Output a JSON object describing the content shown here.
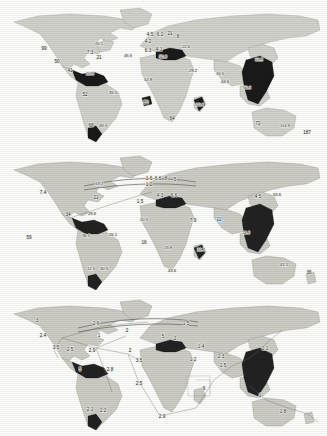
{
  "figure": {
    "type": "three-panel-world-map",
    "panel_count": 3,
    "background_color": "#fdfdfc",
    "land_color": "#d2d2cc",
    "highlight_color": "#1a1a1a",
    "flow_line_color": "#6d6d68"
  },
  "chart_data": {
    "type": "map",
    "title": "",
    "panels": [
      {
        "id": "panel-a",
        "index": 0,
        "has_flow_lines": false,
        "labels": [
          {
            "text": "99",
            "x": 44,
            "y": 50,
            "region": "western-north-america"
          },
          {
            "text": "50",
            "x": 57,
            "y": 63,
            "region": "baja-california"
          },
          {
            "text": "41",
            "x": 70,
            "y": 72,
            "region": "central-america"
          },
          {
            "text": "20.1",
            "x": 99,
            "y": 45,
            "region": "eastern-canada"
          },
          {
            "text": "7.3",
            "x": 90,
            "y": 54,
            "region": "northeast-usa"
          },
          {
            "text": "21",
            "x": 99,
            "y": 59,
            "region": "north-atlantic"
          },
          {
            "text": "20.6",
            "x": 90,
            "y": 75,
            "region": "caribbean"
          },
          {
            "text": "52",
            "x": 85,
            "y": 96,
            "region": "brazil-west"
          },
          {
            "text": "35.1",
            "x": 113,
            "y": 94,
            "region": "brazil-east"
          },
          {
            "text": "68",
            "x": 91,
            "y": 127,
            "region": "southern-cone-west"
          },
          {
            "text": "49.3",
            "x": 103,
            "y": 127,
            "region": "southern-cone-east"
          },
          {
            "text": "45.5",
            "x": 128,
            "y": 57,
            "region": "north-atlantic-east"
          },
          {
            "text": "4.5",
            "x": 150,
            "y": 36,
            "region": "north-sea"
          },
          {
            "text": "6.2",
            "x": 160,
            "y": 36,
            "region": "scandinavia"
          },
          {
            "text": "21",
            "x": 170,
            "y": 35,
            "region": "baltic"
          },
          {
            "text": "8",
            "x": 178,
            "y": 38,
            "region": "russia-west"
          },
          {
            "text": "4.2",
            "x": 148,
            "y": 43,
            "region": "british-isles"
          },
          {
            "text": "6.3",
            "x": 148,
            "y": 52,
            "region": "iberia"
          },
          {
            "text": "4.1",
            "x": 159,
            "y": 51,
            "region": "france"
          },
          {
            "text": "52.8",
            "x": 163,
            "y": 58,
            "region": "mediterranean"
          },
          {
            "text": "22.6",
            "x": 186,
            "y": 48,
            "region": "black-sea"
          },
          {
            "text": "52.8",
            "x": 148,
            "y": 81,
            "region": "west-africa"
          },
          {
            "text": "29.2",
            "x": 193,
            "y": 72,
            "region": "middle-east"
          },
          {
            "text": "50",
            "x": 146,
            "y": 104,
            "region": "gulf-of-guinea"
          },
          {
            "text": "64",
            "x": 172,
            "y": 120,
            "region": "southern-africa"
          },
          {
            "text": "20.6",
            "x": 200,
            "y": 106,
            "region": "madagascar"
          },
          {
            "text": "16.5",
            "x": 220,
            "y": 75,
            "region": "south-asia"
          },
          {
            "text": "44.6",
            "x": 225,
            "y": 83,
            "region": "india"
          },
          {
            "text": "63.5",
            "x": 259,
            "y": 61,
            "region": "east-asia"
          },
          {
            "text": "50.6",
            "x": 247,
            "y": 89,
            "region": "southeast-asia"
          },
          {
            "text": "72",
            "x": 258,
            "y": 125,
            "region": "australia-west"
          },
          {
            "text": "114.9",
            "x": 285,
            "y": 127,
            "region": "australia-east"
          },
          {
            "text": "187",
            "x": 307,
            "y": 134,
            "region": "new-zealand"
          }
        ]
      },
      {
        "id": "panel-b",
        "index": 1,
        "has_flow_lines": true,
        "labels": [
          {
            "text": "7.4",
            "x": 43,
            "y": 194,
            "region": "western-north-america"
          },
          {
            "text": "13.2",
            "x": 99,
            "y": 185,
            "region": "north-atlantic-route"
          },
          {
            "text": "21",
            "x": 96,
            "y": 199,
            "region": "north-atlantic"
          },
          {
            "text": "34",
            "x": 68,
            "y": 216,
            "region": "central-america"
          },
          {
            "text": "29.6",
            "x": 92,
            "y": 215,
            "region": "caribbean"
          },
          {
            "text": "36.5",
            "x": 86,
            "y": 237,
            "region": "brazil-west"
          },
          {
            "text": "26.1",
            "x": 113,
            "y": 236,
            "region": "brazil-east"
          },
          {
            "text": "12.5",
            "x": 91,
            "y": 270,
            "region": "southern-cone-west"
          },
          {
            "text": "30.5",
            "x": 104,
            "y": 270,
            "region": "southern-cone-east"
          },
          {
            "text": "59",
            "x": 29,
            "y": 239,
            "region": "pacific-west"
          },
          {
            "text": "1.6",
            "x": 149,
            "y": 180,
            "region": "north-sea"
          },
          {
            "text": "6.6",
            "x": 158,
            "y": 180,
            "region": "scandinavia"
          },
          {
            "text": "8",
            "x": 166,
            "y": 180,
            "region": "baltic"
          },
          {
            "text": "5",
            "x": 175,
            "y": 181,
            "region": "russia-west"
          },
          {
            "text": "1.2",
            "x": 149,
            "y": 186,
            "region": "british-isles"
          },
          {
            "text": "1.5",
            "x": 140,
            "y": 203,
            "region": "iberia"
          },
          {
            "text": "4.3",
            "x": 160,
            "y": 197,
            "region": "central-europe"
          },
          {
            "text": "6.6",
            "x": 174,
            "y": 197,
            "region": "black-sea"
          },
          {
            "text": "20.5",
            "x": 144,
            "y": 221,
            "region": "west-africa"
          },
          {
            "text": "7.9",
            "x": 193,
            "y": 222,
            "region": "middle-east"
          },
          {
            "text": "11",
            "x": 219,
            "y": 221,
            "region": "south-asia"
          },
          {
            "text": "16",
            "x": 144,
            "y": 244,
            "region": "gulf-of-guinea"
          },
          {
            "text": "23.8",
            "x": 168,
            "y": 249,
            "region": "central-africa"
          },
          {
            "text": "43.6",
            "x": 172,
            "y": 272,
            "region": "southern-africa"
          },
          {
            "text": "22.7",
            "x": 201,
            "y": 251,
            "region": "madagascar"
          },
          {
            "text": "4.5",
            "x": 258,
            "y": 198,
            "region": "east-asia"
          },
          {
            "text": "53.6",
            "x": 277,
            "y": 196,
            "region": "japan"
          },
          {
            "text": "24.6",
            "x": 246,
            "y": 234,
            "region": "southeast-asia"
          },
          {
            "text": "41.1",
            "x": 284,
            "y": 266,
            "region": "australia-east"
          },
          {
            "text": "36",
            "x": 309,
            "y": 274,
            "region": "new-zealand"
          }
        ]
      },
      {
        "id": "panel-c",
        "index": 2,
        "has_flow_lines": true,
        "labels": [
          {
            "text": "3",
            "x": 37,
            "y": 322,
            "region": "northwest-canada"
          },
          {
            "text": "2.4",
            "x": 43,
            "y": 337,
            "region": "western-north-america"
          },
          {
            "text": "3.5",
            "x": 56,
            "y": 349,
            "region": "baja-california"
          },
          {
            "text": "2.5",
            "x": 70,
            "y": 351,
            "region": "central-america"
          },
          {
            "text": "2.6",
            "x": 96,
            "y": 325,
            "region": "north-atlantic-route"
          },
          {
            "text": "1",
            "x": 99,
            "y": 337,
            "region": "north-atlantic"
          },
          {
            "text": "2.9",
            "x": 92,
            "y": 352,
            "region": "caribbean"
          },
          {
            "text": "5",
            "x": 80,
            "y": 371,
            "region": "brazil-west"
          },
          {
            "text": "2.8",
            "x": 110,
            "y": 371,
            "region": "brazil-east"
          },
          {
            "text": "2.1",
            "x": 90,
            "y": 411,
            "region": "southern-cone-west"
          },
          {
            "text": "2.2",
            "x": 103,
            "y": 412,
            "region": "southern-cone-east"
          },
          {
            "text": "2",
            "x": 127,
            "y": 332,
            "region": "mid-atlantic"
          },
          {
            "text": "2",
            "x": 130,
            "y": 352,
            "region": "atlantic-south"
          },
          {
            "text": "3.5",
            "x": 139,
            "y": 362,
            "region": "west-africa"
          },
          {
            "text": "2.5",
            "x": 139,
            "y": 385,
            "region": "south-atlantic"
          },
          {
            "text": "2.9",
            "x": 162,
            "y": 418,
            "region": "cape-route"
          },
          {
            "text": "1.5",
            "x": 186,
            "y": 325,
            "region": "russia-west"
          },
          {
            "text": "5",
            "x": 163,
            "y": 338,
            "region": "central-europe"
          },
          {
            "text": "2",
            "x": 175,
            "y": 340,
            "region": "black-sea"
          },
          {
            "text": "1.4",
            "x": 201,
            "y": 348,
            "region": "middle-east"
          },
          {
            "text": "1.2",
            "x": 193,
            "y": 361,
            "region": "arabian-sea"
          },
          {
            "text": "2.3",
            "x": 221,
            "y": 358,
            "region": "south-asia"
          },
          {
            "text": "1.5",
            "x": 223,
            "y": 367,
            "region": "india"
          },
          {
            "text": "6",
            "x": 204,
            "y": 390,
            "region": "indian-ocean"
          },
          {
            "text": "2.1",
            "x": 265,
            "y": 350,
            "region": "east-asia"
          },
          {
            "text": "1",
            "x": 260,
            "y": 397,
            "region": "australia-west"
          },
          {
            "text": "1.8",
            "x": 283,
            "y": 413,
            "region": "australia-east"
          }
        ]
      }
    ]
  }
}
